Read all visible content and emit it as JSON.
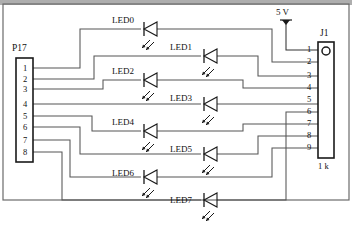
{
  "diagram": {
    "title_visible": false,
    "type": "schematic",
    "colors": {
      "wire": "#4a4a4a",
      "outline": "#1a1a1a",
      "text": "#111111",
      "background": "#ffffff"
    }
  },
  "power": {
    "label": "5 V",
    "symbol_name": "power-rail-arrow"
  },
  "connectors": [
    {
      "id": "P17",
      "label": "P17",
      "pin_count": 8,
      "pins": [
        "1",
        "2",
        "3",
        "4",
        "5",
        "6",
        "7",
        "8"
      ],
      "side": "left"
    },
    {
      "id": "J1",
      "label": "J1",
      "pin_count": 9,
      "pins": [
        "1",
        "2",
        "3",
        "4",
        "5",
        "6",
        "7",
        "8",
        "9"
      ],
      "side": "right",
      "footer_label": "1 k",
      "has_keyed_hole": true
    }
  ],
  "leds": [
    {
      "name": "LED0",
      "column": "left",
      "label_x": 112,
      "label_y": 16,
      "sym_x": 145,
      "sym_y": 29
    },
    {
      "name": "LED1",
      "column": "right",
      "label_x": 170,
      "label_y": 43,
      "sym_x": 205,
      "sym_y": 56
    },
    {
      "name": "LED2",
      "column": "left",
      "label_x": 112,
      "label_y": 67,
      "sym_x": 145,
      "sym_y": 80
    },
    {
      "name": "LED3",
      "column": "right",
      "label_x": 170,
      "label_y": 94,
      "sym_x": 205,
      "sym_y": 107
    },
    {
      "name": "LED4",
      "column": "left",
      "label_x": 112,
      "label_y": 118,
      "sym_x": 145,
      "sym_y": 131
    },
    {
      "name": "LED5",
      "column": "right",
      "label_x": 170,
      "label_y": 145,
      "sym_x": 205,
      "sym_y": 158
    },
    {
      "name": "LED6",
      "column": "left",
      "label_x": 112,
      "label_y": 169,
      "sym_x": 145,
      "sym_y": 182
    },
    {
      "name": "LED7",
      "column": "right",
      "label_x": 170,
      "label_y": 196,
      "sym_x": 205,
      "sym_y": 209
    }
  ]
}
